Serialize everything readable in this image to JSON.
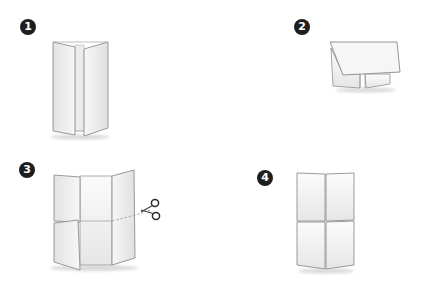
{
  "diagram": {
    "type": "folding-instructions",
    "steps": [
      {
        "number": "1",
        "description": "Sheet folded into three vertical panels with outer flaps opened"
      },
      {
        "number": "2",
        "description": "Folded sheet with top flap folded down over two tabs"
      },
      {
        "number": "3",
        "description": "Unfolded panels showing horizontal fold line; cut along the line with scissors"
      },
      {
        "number": "4",
        "description": "Result: four panels arranged in a 2x2 grid"
      }
    ],
    "icons": {
      "scissors": "scissors-icon"
    },
    "colors": {
      "badge": "#1e1e1e",
      "badge_text": "#ffffff",
      "panel_fill": "#f4f4f4",
      "panel_edge": "#9a9a9a",
      "background": "#ffffff"
    }
  }
}
